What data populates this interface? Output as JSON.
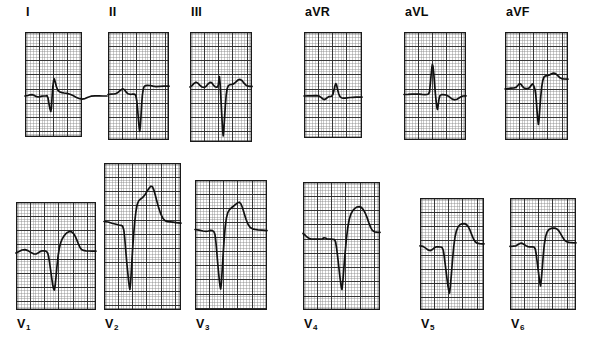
{
  "figure": {
    "kind": "12-lead-electrocardiogram",
    "background_color": "#ffffff",
    "grid_fine_color": "#8c8c8c",
    "grid_bold_color": "#2b2b2b",
    "border_color": "#1a1a1a",
    "trace_color": "#111111",
    "rows": 2,
    "columns": 6
  },
  "leads": [
    {
      "id": "I",
      "label": "I",
      "subscript": "",
      "label_x": 26,
      "label_y": 6,
      "panel": {
        "x": 25,
        "y": 32,
        "w": 57,
        "h": 105
      },
      "grid": {
        "cell": 2.85,
        "bold_every": 5
      },
      "baseline_y": 64,
      "trace": "M0,64 L3,63.5 L5,62.8 L7,62.6 L9,63.2 L11,64.4 L13,65.0 L15,64.6 L17,64.2 L19,64.0 L20.5,64.0 L22,63.6 L23,66 L24,72 L25,77 L25.8,79.5 L26.4,76 L27,66 L27.8,55 L28.6,48.5 L29.4,47 L30.2,50 L31.5,55 L33,58.5 L35,60 L37,60.6 L39,61 L42,61.4 L45,62.2 L48,63.6 L51,65.2 L54,66.5 L57,67.1 L60,66.6 L63,65.2 L66,64.2 L70,63.8 L74,63.8 L78,64.0 L82,64.0"
    },
    {
      "id": "II",
      "label": "II",
      "subscript": "",
      "label_x": 109,
      "label_y": 6,
      "panel": {
        "x": 108,
        "y": 32,
        "w": 61,
        "h": 108
      },
      "grid": {
        "cell": 2.85,
        "bold_every": 5
      },
      "baseline_y": 62,
      "trace": "M0,62.5 L3,62.2 L6,62.0 L8,61.6 L10,60.4 L12,58.6 L14,57.2 L15.5,57.0 L17,58.4 L18.5,60.4 L20,61.8 L22,62.3 L24,62.2 L25.5,62.0 L27,62.4 L28,64.5 L28.8,69 L29.6,77 L30.4,87 L31.1,95 L31.7,99.5 L32.3,95 L33,84 L33.7,72 L34.4,63 L35.2,57.5 L36,54.8 L37,53.8 L39,53.4 L42,53.5 L45,54.2 L48,54.6 L52,54.4 L56,54.2 L61,54.2"
    },
    {
      "id": "III",
      "label": "III",
      "subscript": "",
      "label_x": 191,
      "label_y": 6,
      "panel": {
        "x": 190,
        "y": 32,
        "w": 62,
        "h": 110
      },
      "grid": {
        "cell": 2.85,
        "bold_every": 5
      },
      "baseline_y": 54,
      "trace": "M0,55 L2,53.6 L4,51.4 L6,50.2 L8,51.2 L10,53.4 L12,55 L14,55.4 L16,54.4 L18,52.0 L20,50.4 L21.5,50.6 L23,52.6 L25,54.8 L26.5,55.2 L27.5,55.0 L28.3,53.0 L28.9,47.5 L29.4,44.5 L30,50 L30.7,62 L31.4,76 L32.1,89 L32.7,99 L33.2,104 L33.8,99 L34.5,87 L35.3,74 L36.2,63 L37.2,56.5 L38.4,53.6 L40,52.6 L42,52.4 L44,51.6 L46,49.8 L48,48.0 L50,47.4 L52,48.6 L54,51.2 L56,53.2 L58,54.2 L60,54.4 L62,54.4"
    },
    {
      "id": "aVR",
      "label": "aVR",
      "subscript": "",
      "label_x": 305,
      "label_y": 6,
      "panel": {
        "x": 304,
        "y": 32,
        "w": 58,
        "h": 106
      },
      "grid": {
        "cell": 2.85,
        "bold_every": 5
      },
      "baseline_y": 64,
      "trace": "M0,64 L4,63.9 L8,63.8 L12,63.7 L15,64.0 L17,65.4 L19,67.0 L20.5,67.6 L22,66.8 L23.5,65.4 L25,64.6 L26.5,64.5 L28,64.0 L29,62.0 L30,58.0 L31,53.6 L31.8,51.6 L32.6,53.0 L33.6,57.6 L34.8,62.0 L36,64.6 L37.5,65.8 L39,66.2 L41,66.1 L43,65.8 L46,65.5 L49,65.3 L52,65.2 L55,65.1 L58,65.1"
    },
    {
      "id": "aVL",
      "label": "aVL",
      "subscript": "",
      "label_x": 405,
      "label_y": 6,
      "panel": {
        "x": 404,
        "y": 32,
        "w": 62,
        "h": 108
      },
      "grid": {
        "cell": 2.85,
        "bold_every": 5
      },
      "baseline_y": 62,
      "trace": "M0,62.5 L4,62.4 L8,62.2 L12,62.0 L15,62.1 L18,62.4 L21,62.6 L23,62.4 L24.5,62.0 L25.5,60.0 L26.3,52 L27.1,43 L27.8,36 L28.4,32.5 L29,34.5 L29.8,42 L30.6,52 L31.4,62 L32.2,70 L32.9,75.5 L33.5,77.5 L34.2,73 L35,67 L36,63.6 L37.5,62.6 L39,62.6 L41,62.8 L43,63.4 L45,64.6 L47,66.2 L49,67.4 L51,67.8 L53,67.2 L55,66.0 L57,64.8 L59,64.0 L62,63.8"
    },
    {
      "id": "aVF",
      "label": "aVF",
      "subscript": "",
      "label_x": 506,
      "label_y": 6,
      "panel": {
        "x": 505,
        "y": 32,
        "w": 63,
        "h": 108
      },
      "grid": {
        "cell": 2.85,
        "bold_every": 5
      },
      "baseline_y": 56,
      "trace": "M0,57 L3,56.6 L6,56.2 L9,56.0 L11,55.4 L13,53.2 L14.5,51.6 L16,52.2 L17.5,54.4 L19,56.0 L21,56.6 L23,56.4 L24.5,55.8 L26,53.6 L27.3,52.0 L28.3,52.8 L29.2,55.0 L30,57.6 L30.7,62 L31.4,70 L32.1,80 L32.8,88 L33.4,92.5 L34,88 L34.8,77 L35.7,65 L36.7,55 L37.8,48.4 L39,45.0 L40.5,43.8 L42.5,43.6 L44.5,43.0 L46.5,41.8 L48.5,41.0 L50.5,41.6 L52.5,43.4 L54.5,45.4 L56.5,46.6 L59,47.0 L63,47.2"
    },
    {
      "id": "V1",
      "label": "V",
      "subscript": "1",
      "label_x": 17,
      "label_y": 318,
      "panel": {
        "x": 16,
        "y": 202,
        "w": 80,
        "h": 108
      },
      "grid": {
        "cell": 2.85,
        "bold_every": 5
      },
      "baseline_y": 50,
      "trace": "M0,51 L3,49.6 L6,48.0 L9,47.6 L12,48.6 L15,50.6 L18,52.0 L20,52.0 L22,51.0 L24,49.6 L26,48.8 L28,48.8 L30,49.2 L31.5,50.6 L32.5,54 L33.5,60 L34.6,68 L35.7,76 L36.7,82.5 L37.5,86.5 L38.3,88 L39.1,84 L40,75 L41,64 L42.1,54 L43.3,46.4 L44.6,41.0 L46,37.4 L47.6,34.6 L49.4,32.2 L51.4,30.4 L53.5,29.4 L55.6,29.8 L57.6,31.6 L59.4,34.6 L61,38.4 L62.5,42.2 L64,45.4 L65.5,47.4 L67.5,48.4 L70,48.8 L73,49.0 L76,49.1 L80,49.2"
    },
    {
      "id": "V2",
      "label": "V",
      "subscript": "2",
      "label_x": 105,
      "label_y": 318,
      "panel": {
        "x": 104,
        "y": 163,
        "w": 77,
        "h": 147
      },
      "grid": {
        "cell": 2.85,
        "bold_every": 5
      },
      "baseline_y": 62,
      "trace": "M0,58.5 L4,59.0 L8,60.2 L12,61.2 L15,62.0 L17,62.4 L18.6,63.0 L19.8,67 L20.8,76 L21.8,88 L22.8,100 L23.8,110 L24.6,118 L25.3,123.5 L25.9,126.5 L26.6,120 L27.5,105 L28.5,88 L29.6,72 L30.8,58 L32,48 L33.2,41.5 L34.6,38.0 L36.4,36.2 L38.5,34.6 L40.8,32.0 L43,28.4 L45,25.2 L46.8,23.2 L48.4,23.6 L49.8,26.8 L51.2,31.8 L52.8,38.0 L54.6,44.6 L56.6,50.6 L58.8,55.2 L61,57.6 L63.5,58.6 L66,58.9 L69,59.2 L72,59.6 L77,60.2"
    },
    {
      "id": "V3",
      "label": "V",
      "subscript": "3",
      "label_x": 196,
      "label_y": 318,
      "panel": {
        "x": 195,
        "y": 180,
        "w": 72,
        "h": 130
      },
      "grid": {
        "cell": 2.85,
        "bold_every": 5
      },
      "baseline_y": 53,
      "trace": "M0,49.5 L4,50.2 L8,51.0 L11,51.4 L13.5,51.0 L15.5,50.4 L17.5,50.6 L19,51.8 L20,54.6 L20.9,62 L21.8,72 L22.7,83 L23.6,93 L24.4,101 L25.1,106.5 L25.7,109 L26.4,103 L27.2,90 L28.1,75 L29.1,60 L30.2,47 L31.4,38.0 L32.8,32.6 L34.5,29.6 L36.4,27.8 L38.5,26.2 L40.6,24.4 L42.6,22.8 L44.4,22.2 L46,24.0 L47.6,28.0 L49.2,33.4 L51,39.2 L53,44.2 L55.2,47.4 L57.5,48.8 L60,49.4 L63,49.8 L67,50.2 L72,50.6"
    },
    {
      "id": "V4",
      "label": "V",
      "subscript": "4",
      "label_x": 304,
      "label_y": 318,
      "panel": {
        "x": 303,
        "y": 182,
        "w": 77,
        "h": 128
      },
      "grid": {
        "cell": 2.85,
        "bold_every": 5
      },
      "baseline_y": 57,
      "trace": "M0,51.5 L2,53.0 L4,55.0 L6,56.4 L8,57.0 L11,57.2 L14,57.2 L17,57.2 L19.5,56.8 L21,55.8 L22.5,56.0 L24,57.0 L26,57.2 L28,57.2 L30,57.3 L31.5,57.6 L32.6,60 L33.6,66 L34.7,75 L35.8,85 L36.8,94 L37.7,101 L38.4,105.5 L39,107.5 L39.8,100 L40.8,87 L42,72 L43.3,58 L44.7,46.0 L46.2,37.5 L47.9,32.0 L49.8,28.6 L51.9,26.4 L54,25.0 L56.2,24.6 L58.3,25.4 L60.3,27.6 L62.2,31.0 L64,35.4 L65.8,40.6 L67.6,45.4 L69.5,48.6 L71.5,49.8 L74,50.2 L77,50.4"
    },
    {
      "id": "V5",
      "label": "V",
      "subscript": "5",
      "label_x": 421,
      "label_y": 318,
      "panel": {
        "x": 420,
        "y": 198,
        "w": 64,
        "h": 112
      },
      "grid": {
        "cell": 2.85,
        "bold_every": 5
      },
      "baseline_y": 48,
      "trace": "M0,47.8 L3,48.4 L6,50.4 L8.5,52.2 L10.5,52.6 L12.5,51.4 L14.5,49.6 L16.5,48.8 L18.5,48.8 L20.5,49.0 L22,49.4 L23.2,52 L24.2,58 L25.3,67 L26.4,76 L27.4,84 L28.3,90 L29,93.5 L29.6,95 L30.4,88 L31.4,76 L32.5,62 L33.7,49 L35,39.0 L36.4,32.8 L38,29.0 L39.9,26.8 L42,25.8 L44.2,25.6 L46.3,26.4 L48.2,28.6 L50,32.2 L51.7,36.6 L53.4,40.8 L55.2,43.8 L57.2,45.2 L59.5,45.6 L62,45.8 L64,45.9"
    },
    {
      "id": "V6",
      "label": "V",
      "subscript": "6",
      "label_x": 511,
      "label_y": 318,
      "panel": {
        "x": 510,
        "y": 198,
        "w": 66,
        "h": 112
      },
      "grid": {
        "cell": 2.85,
        "bold_every": 5
      },
      "baseline_y": 48,
      "trace": "M0,48.4 L3,48.2 L6,47.8 L8,46.6 L10,45.4 L12,45.2 L14,46.4 L16,47.8 L18,48.6 L20,48.8 L22,48.9 L24,49.0 L25.3,51 L26.3,57 L27.3,65 L28.3,73 L29.2,80 L30,85.5 L30.6,88 L31.3,82 L32.2,71 L33.2,58 L34.3,46.5 L35.6,38.5 L37.1,34.0 L38.9,31.6 L41,30.4 L43.2,30.0 L45.4,30.2 L47.4,31.2 L49.2,33.4 L51,36.4 L52.8,39.6 L54.6,42.2 L56.6,43.8 L59,44.4 L62,44.7 L66,44.9"
    }
  ]
}
